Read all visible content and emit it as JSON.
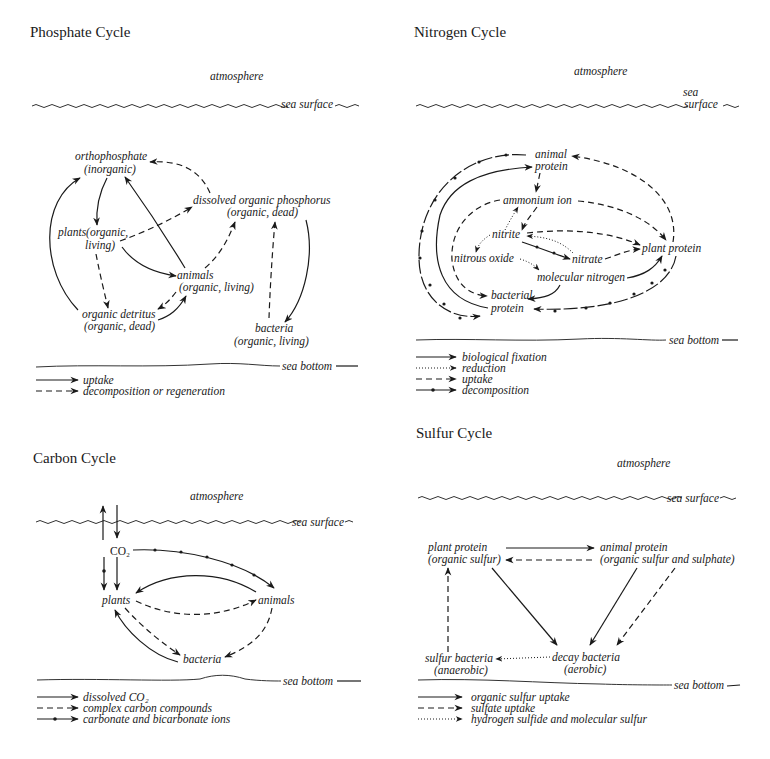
{
  "phosphate": {
    "title": "Phosphate Cycle",
    "atmosphere": "atmosphere",
    "sea_surface": "sea surface",
    "sea_bottom": "sea bottom",
    "nodes": {
      "orthophosphate_1": "orthophosphate",
      "orthophosphate_2": "(inorganic)",
      "dop_1": "dissolved organic phosphorus",
      "dop_2": "(organic, dead)",
      "plants_1": "plants(organic,",
      "plants_2": "living)",
      "animals_1": "animals",
      "animals_2": "(organic, living)",
      "detritus_1": "organic detritus",
      "detritus_2": "(organic, dead)",
      "bacteria_1": "bacteria",
      "bacteria_2": "(organic, living)"
    },
    "legend": [
      {
        "style": "solid",
        "label": "uptake"
      },
      {
        "style": "dashed",
        "label": "decomposition or regeneration"
      }
    ]
  },
  "nitrogen": {
    "title": "Nitrogen Cycle",
    "atmosphere": "atmosphere",
    "sea_surface_1": "sea",
    "sea_surface_2": "surface",
    "sea_bottom": "sea bottom",
    "nodes": {
      "animal_protein_1": "animal",
      "animal_protein_2": "protein",
      "ammonium": "ammonium ion",
      "nitrite": "nitrite",
      "nitrous_oxide": "nitrous oxide",
      "nitrate": "nitrate",
      "plant_protein": "plant protein",
      "molecular_nitrogen": "molecular nitrogen",
      "bacterial_protein_1": "bacterial",
      "bacterial_protein_2": "protein"
    },
    "legend": [
      {
        "style": "solid",
        "label": "biological fixation"
      },
      {
        "style": "dotted",
        "label": "reduction"
      },
      {
        "style": "dashed",
        "label": "uptake"
      },
      {
        "style": "dot-dash",
        "label": "decomposition"
      }
    ]
  },
  "carbon": {
    "title": "Carbon Cycle",
    "atmosphere": "atmosphere",
    "sea_surface": "sea surface",
    "sea_bottom": "sea bottom",
    "nodes": {
      "co2": "CO₂",
      "plants": "plants",
      "animals": "animals",
      "bacteria": "bacteria"
    },
    "legend": [
      {
        "style": "solid",
        "label": "dissolved CO₂"
      },
      {
        "style": "dashed",
        "label": "complex carbon compounds"
      },
      {
        "style": "dot-dash",
        "label": "carbonate and bicarbonate ions"
      }
    ]
  },
  "sulfur": {
    "title": "Sulfur Cycle",
    "atmosphere": "atmosphere",
    "sea_surface": "sea surface",
    "sea_bottom": "sea bottom",
    "nodes": {
      "plant_protein_1": "plant protein",
      "plant_protein_2": "(organic sulfur)",
      "animal_protein_1": "animal protein",
      "animal_protein_2": "(organic sulfur and sulphate)",
      "sulfur_bacteria_1": "sulfur bacteria",
      "sulfur_bacteria_2": "(anaerobic)",
      "decay_bacteria_1": "decay bacteria",
      "decay_bacteria_2": "(aerobic)"
    },
    "legend": [
      {
        "style": "solid",
        "label": "organic sulfur uptake"
      },
      {
        "style": "dashed",
        "label": "sulfate uptake"
      },
      {
        "style": "dotted",
        "label": "hydrogen sulfide and molecular sulfur"
      }
    ]
  }
}
